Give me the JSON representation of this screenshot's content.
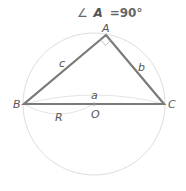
{
  "title": {
    "angle_symbol": "∠",
    "vertex": "A",
    "equals_value": "=90°"
  },
  "vertices": {
    "A": "A",
    "B": "B",
    "C": "C",
    "O": "O"
  },
  "sides": {
    "a": "a",
    "b": "b",
    "c": "c",
    "R": "R"
  },
  "colors": {
    "triangle": "#7a7a7a",
    "circle": "#dcdcdc",
    "arc": "#e2e2e2",
    "label": "#555555",
    "center_dot": "#8a8a8a"
  }
}
